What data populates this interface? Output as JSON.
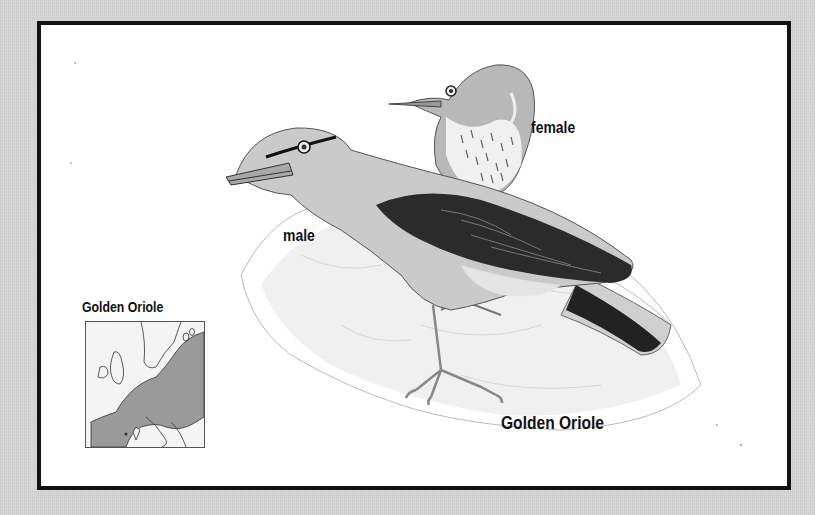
{
  "plate": {
    "title": "Golden Oriole",
    "labels": {
      "female": "female",
      "male": "male"
    },
    "range_map": {
      "title": "Golden Oriole",
      "region": "Europe",
      "range_color": "#9a9a9a"
    },
    "colors": {
      "background": "#d6d6d6",
      "frame_border": "#111111",
      "frame_fill": "#ffffff",
      "wing_dark": "#2a2a2a",
      "body_light": "#c8c8c8"
    }
  }
}
